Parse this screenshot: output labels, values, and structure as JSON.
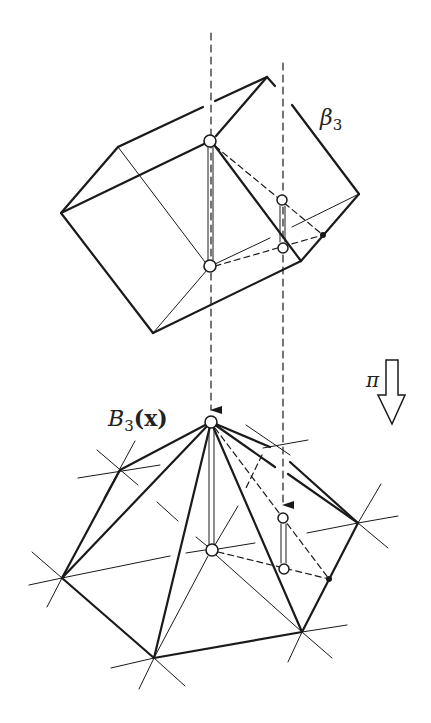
{
  "figure": {
    "upper_label": "β",
    "upper_label_sub": "3",
    "lower_label_main": "B",
    "lower_label_sub": "3",
    "lower_label_arg": "(x)",
    "projection_label": "π"
  },
  "colors": {
    "stroke": "#1a1a1a",
    "background": "#ffffff"
  }
}
